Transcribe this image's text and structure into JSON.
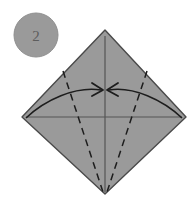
{
  "figure": {
    "kind": "origami-fold-diagram",
    "step_badge": {
      "label": "2",
      "shape": "circle",
      "fill": "#9a9a9a",
      "stroke": "#8f8f8f",
      "text_color": "#5d5d5d",
      "cx": 36,
      "cy": 35,
      "r": 22
    },
    "background_color": "#ffffff",
    "paper": {
      "name": "square-rotated-45",
      "fill": "#9a9a9a",
      "stroke": "#4a4a4a",
      "stroke_width": 1.4,
      "vertices": {
        "top": [
          105,
          30
        ],
        "right": [
          186,
          117
        ],
        "bottom": [
          105,
          194
        ],
        "left": [
          22,
          117
        ]
      },
      "points": "105,30 186,117 105,194 22,117"
    },
    "creases": {
      "existing_color": "#555555",
      "existing_width": 1.2,
      "fold_color": "#1d1d1d",
      "fold_width": 1.5,
      "fold_dash": "7 5",
      "vertical_axis": {
        "x1": 105,
        "y1": 36,
        "x2": 105,
        "y2": 192
      },
      "horizontal_axis": {
        "x1": 26,
        "y1": 117,
        "x2": 182,
        "y2": 117
      },
      "valley_left": {
        "x1": 63,
        "y1": 71,
        "x2": 103,
        "y2": 192
      },
      "valley_right": {
        "x1": 147,
        "y1": 71,
        "x2": 107,
        "y2": 192
      }
    },
    "arrows": {
      "color": "#1d1d1d",
      "width": 1.6,
      "head_length": 11,
      "left": {
        "name": "fold-arrow-left",
        "path": "M 26,118 C 45,100 75,86 101,90",
        "tip": [
          103,
          90
        ],
        "direction": "left-edge-to-center"
      },
      "right": {
        "name": "fold-arrow-right",
        "path": "M 182,118 C 163,100 133,86 109,90",
        "tip": [
          107,
          90
        ],
        "direction": "right-edge-to-center"
      }
    }
  }
}
